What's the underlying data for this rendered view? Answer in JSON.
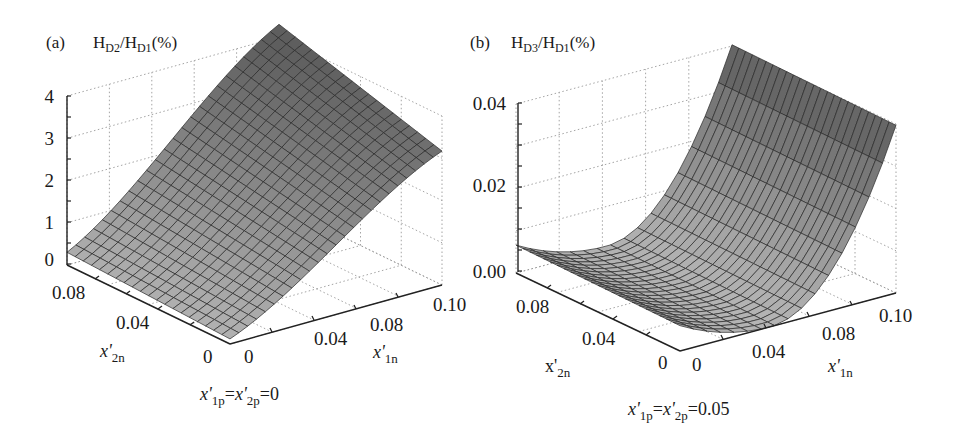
{
  "figure": {
    "background": "#ffffff",
    "surface_color_dark": "#5e5e5e",
    "surface_color_light": "#b4b4b4",
    "mesh_color": "#2a2a2a"
  },
  "chart_data": [
    {
      "id": "a",
      "type": "surface3d",
      "panel_label": "(a)",
      "title": "H_D2/H_D1(%)",
      "title_parts": {
        "main1": "H",
        "sub1": "D2",
        "slash": "/H",
        "sub2": "D1",
        "tail": "(%)"
      },
      "zlabel": "H_D2/H_D1(%)",
      "xlabel": "x'_1n",
      "ylabel": "x'_2n",
      "condition": "x'_1p = x'_2p = 0",
      "condition_parts": {
        "a": "x'",
        "a_sub": "1p",
        "eq1": "=",
        "b": "x'",
        "b_sub": "2p",
        "eq2": "=0"
      },
      "x_axis": {
        "name": "x'1n",
        "range": [
          0,
          0.1
        ],
        "tick_labels": [
          "0",
          "0.04",
          "0.08",
          "0.10"
        ]
      },
      "y_axis": {
        "name": "x'2n",
        "range": [
          0,
          0.09
        ],
        "tick_labels": [
          "0",
          "0.04",
          "0.08"
        ]
      },
      "z_axis": {
        "range": [
          0,
          4
        ],
        "tick_labels": [
          "0",
          "1",
          "2",
          "3",
          "4"
        ]
      },
      "grid": true,
      "description": "Surface increases roughly linearly with x'1n (weak dependence on x'2n); ~0.3 at x'1n=0, ~4 at x'1n=0.10 for back edge, ~2.5 at right front.",
      "surface_samples": {
        "x1n": [
          0,
          0.02,
          0.04,
          0.06,
          0.08,
          0.1
        ],
        "z_at_x2n_0": [
          0.1,
          0.4,
          1.1,
          1.8,
          2.5,
          3.2
        ],
        "z_at_x2n_0.09": [
          0.3,
          0.8,
          1.7,
          2.6,
          3.4,
          4.0
        ]
      }
    },
    {
      "id": "b",
      "type": "surface3d",
      "panel_label": "(b)",
      "title": "H_D3/H_D1(%)",
      "title_parts": {
        "main1": "H",
        "sub1": "D3",
        "slash": "/H",
        "sub2": "D1",
        "tail": "(%)"
      },
      "zlabel": "H_D3/H_D1(%)",
      "xlabel": "x'_1n",
      "ylabel": "x'_2n",
      "condition": "x'_1p = x'_2p = 0.05",
      "condition_parts": {
        "a": "x'",
        "a_sub": "1p",
        "eq1": "=",
        "b": "x'",
        "b_sub": "2p",
        "eq2": "=0.05"
      },
      "x_axis": {
        "name": "x'1n",
        "range": [
          0,
          0.1
        ],
        "tick_labels": [
          "0",
          "0.04",
          "0.08",
          "0.10"
        ]
      },
      "y_axis": {
        "name": "x'2n",
        "range": [
          0,
          0.09
        ],
        "tick_labels": [
          "0",
          "0.04",
          "0.08"
        ]
      },
      "z_axis": {
        "range": [
          0,
          0.04
        ],
        "tick_labels": [
          "0.00",
          "0.02",
          "0.04"
        ]
      },
      "grid": true,
      "description": "U-shaped surface in x'1n with minimum near x'1n≈0.05 (≈0); rises to ≈0.006 at x'1n=0 and ≈0.04 at x'1n=0.10.",
      "surface_samples": {
        "x1n": [
          0,
          0.02,
          0.04,
          0.05,
          0.06,
          0.08,
          0.1
        ],
        "z": [
          0.006,
          0.004,
          0.0005,
          0.0,
          0.001,
          0.012,
          0.036
        ]
      }
    }
  ],
  "labels": {
    "a": {
      "panel": "(a)",
      "z_ticks": [
        "0",
        "1",
        "2",
        "3",
        "4"
      ],
      "y_ticks": [
        "0.08",
        "0.04",
        "0"
      ],
      "x_ticks": [
        "0",
        "0.04",
        "0.08",
        "0.10"
      ],
      "y_name": "x'",
      "y_name_sub": "2n",
      "x_name": "x'",
      "x_name_sub": "1n"
    },
    "b": {
      "panel": "(b)",
      "z_ticks": [
        "0.00",
        "0.02",
        "0.04"
      ],
      "y_ticks": [
        "0.08",
        "0.04",
        "0"
      ],
      "x_ticks": [
        "0",
        "0.04",
        "0.08",
        "0.10"
      ],
      "y_name": "x'",
      "y_name_sub": "2n",
      "x_name": "x'",
      "x_name_sub": "1n"
    }
  }
}
